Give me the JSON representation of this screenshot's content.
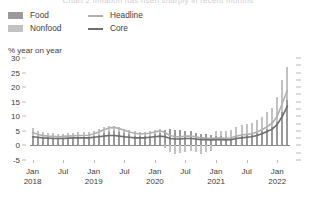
{
  "title_cutoff": "Chart 2  Inflation has risen sharply in recent months",
  "axis": {
    "unit_label": "% year on year",
    "y_ticks": [
      30,
      25,
      20,
      15,
      10,
      5,
      0,
      -5
    ],
    "x_labels": [
      {
        "top": "Jan",
        "bottom": "2018"
      },
      {
        "top": "Jul",
        "bottom": ""
      },
      {
        "top": "Jan",
        "bottom": "2019"
      },
      {
        "top": "Jul",
        "bottom": ""
      },
      {
        "top": "Jan",
        "bottom": "2020"
      },
      {
        "top": "Jul",
        "bottom": ""
      },
      {
        "top": "Jan",
        "bottom": "2021"
      },
      {
        "top": "Jul",
        "bottom": ""
      },
      {
        "top": "Jan",
        "bottom": "2022"
      }
    ]
  },
  "legend": {
    "items": [
      {
        "label": "Food",
        "type": "swatch",
        "color": "#9a9a9a",
        "icon": "square-swatch-icon"
      },
      {
        "label": "Nonfood",
        "type": "swatch",
        "color": "#c2c2c2",
        "icon": "square-swatch-icon"
      },
      {
        "label": "Headline",
        "type": "line",
        "color": "#b0b0b0",
        "icon": "line-swatch-icon"
      },
      {
        "label": "Core",
        "type": "line",
        "color": "#6e6e6e",
        "icon": "line-swatch-icon"
      }
    ]
  },
  "chart_data": {
    "type": "bar",
    "title": "Chart 2  Inflation has risen sharply in recent months",
    "xlabel": "",
    "ylabel": "% year on year",
    "ylim": [
      -5,
      30
    ],
    "grid": false,
    "legend_position": "top-left",
    "stacked": true,
    "x": [
      "2018-01",
      "2018-02",
      "2018-03",
      "2018-04",
      "2018-05",
      "2018-06",
      "2018-07",
      "2018-08",
      "2018-09",
      "2018-10",
      "2018-11",
      "2018-12",
      "2019-01",
      "2019-02",
      "2019-03",
      "2019-04",
      "2019-05",
      "2019-06",
      "2019-07",
      "2019-08",
      "2019-09",
      "2019-10",
      "2019-11",
      "2019-12",
      "2020-01",
      "2020-02",
      "2020-03",
      "2020-04",
      "2020-05",
      "2020-06",
      "2020-07",
      "2020-08",
      "2020-09",
      "2020-10",
      "2020-11",
      "2020-12",
      "2021-01",
      "2021-02",
      "2021-03",
      "2021-04",
      "2021-05",
      "2021-06",
      "2021-07",
      "2021-08",
      "2021-09",
      "2021-10",
      "2021-11",
      "2021-12",
      "2022-01",
      "2022-02",
      "2022-03"
    ],
    "series": [
      {
        "name": "Food",
        "kind": "bar",
        "color": "#9a9a9a",
        "values": [
          3.2,
          2.6,
          2.4,
          2.3,
          2.2,
          2.1,
          2.2,
          2.3,
          2.4,
          2.5,
          2.6,
          2.8,
          3.2,
          3.6,
          4.2,
          4.6,
          4.8,
          4.6,
          4.2,
          3.8,
          3.4,
          3.2,
          3.2,
          3.4,
          3.8,
          4.4,
          5.2,
          5.6,
          5.4,
          5.2,
          5.0,
          4.8,
          4.4,
          4.0,
          3.8,
          3.6,
          3.4,
          3.2,
          3.0,
          3.0,
          3.2,
          3.4,
          3.6,
          3.8,
          4.2,
          4.8,
          5.6,
          6.4,
          8.0,
          11.5,
          15.5
        ]
      },
      {
        "name": "Nonfood",
        "kind": "bar",
        "color": "#c2c2c2",
        "values": [
          2.8,
          2.4,
          2.2,
          2.0,
          1.9,
          1.8,
          1.8,
          1.9,
          2.0,
          2.1,
          2.0,
          1.9,
          1.8,
          1.9,
          2.0,
          2.1,
          2.0,
          1.8,
          1.6,
          1.5,
          1.4,
          1.3,
          1.4,
          1.5,
          1.6,
          1.4,
          -1.0,
          -2.4,
          -2.8,
          -2.6,
          -2.2,
          -1.8,
          -2.4,
          -2.8,
          -2.4,
          -2.0,
          1.6,
          1.8,
          2.0,
          2.4,
          3.2,
          3.6,
          3.8,
          4.0,
          4.4,
          5.0,
          5.8,
          6.6,
          8.5,
          11.0,
          11.5
        ]
      },
      {
        "name": "Headline",
        "kind": "line",
        "color": "#b0b0b0",
        "values": [
          4.4,
          3.8,
          3.4,
          3.2,
          3.1,
          3.0,
          3.1,
          3.2,
          3.3,
          3.4,
          3.4,
          3.5,
          4.0,
          4.6,
          5.4,
          6.0,
          6.2,
          5.8,
          5.2,
          4.6,
          4.2,
          4.0,
          4.0,
          4.2,
          4.6,
          5.0,
          4.4,
          3.4,
          3.0,
          3.0,
          3.2,
          3.2,
          3.0,
          2.6,
          2.6,
          2.4,
          2.6,
          2.6,
          2.4,
          2.6,
          3.2,
          3.6,
          3.8,
          4.0,
          4.6,
          5.4,
          6.4,
          7.6,
          10.0,
          14.5,
          19.0
        ]
      },
      {
        "name": "Core",
        "kind": "line",
        "color": "#6e6e6e",
        "values": [
          3.0,
          2.8,
          2.6,
          2.5,
          2.4,
          2.4,
          2.4,
          2.5,
          2.6,
          2.6,
          2.6,
          2.6,
          2.8,
          3.0,
          3.2,
          3.4,
          3.4,
          3.2,
          3.0,
          2.8,
          2.6,
          2.6,
          2.6,
          2.8,
          3.0,
          3.2,
          3.0,
          2.4,
          2.2,
          2.2,
          2.4,
          2.4,
          2.2,
          2.0,
          2.0,
          1.9,
          2.0,
          2.0,
          1.9,
          2.0,
          2.4,
          2.6,
          2.8,
          3.0,
          3.4,
          4.0,
          4.8,
          5.6,
          7.2,
          10.0,
          13.5
        ]
      }
    ]
  }
}
